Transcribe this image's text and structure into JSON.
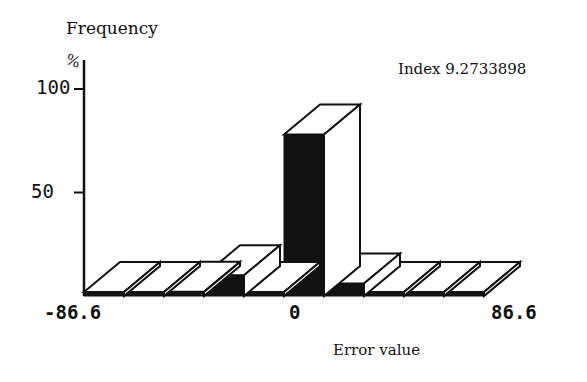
{
  "chart_data": {
    "type": "bar",
    "style": "3d-histogram",
    "title": "",
    "ylabel": "Frequency",
    "yunit": "%",
    "xlabel": "Error value",
    "annotation": "Index 9.2733898",
    "ylim": [
      0,
      100
    ],
    "yticks": [
      "50",
      "100"
    ],
    "xticks": [
      "-86.6",
      "0",
      "86.6"
    ],
    "xrange": [
      -86.6,
      86.6
    ],
    "grid": false,
    "legend": null,
    "categories": [
      "-86.6..-69.3",
      "-69.3..-52.0",
      "-52.0..-34.6",
      "-34.6..-17.3",
      "-17.3..0",
      "0..17.3",
      "17.3..34.6",
      "34.6..52.0",
      "52.0..69.3",
      "69.3..86.6"
    ],
    "values": [
      1,
      1,
      2,
      10,
      1,
      78,
      6,
      1,
      1,
      1
    ]
  },
  "labels": {
    "ylabel": "Frequency",
    "yunit": "%",
    "y100": "100",
    "y50": "50",
    "index": "Index 9.2733898",
    "xmin": "-86.6",
    "xmid": "0",
    "xmax": "86.6",
    "xlabel": "Error value"
  }
}
